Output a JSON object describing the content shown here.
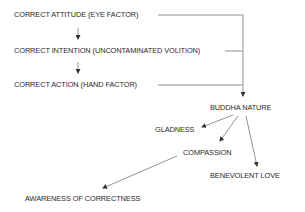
{
  "diagram": {
    "nodes": {
      "attitude": "CORRECT ATTITUDE (EYE FACTOR)",
      "intention": "CORRECT INTENTION (UNCONTAMINATED VOLITION)",
      "action": "CORRECT ACTION (HAND FACTOR)",
      "buddha_nature": "BUDDHA NATURE",
      "gladness": "GLADNESS",
      "compassion": "COMPASSION",
      "benevolent_love": "BENEVOLENT LOVE",
      "awareness": "AWARENESS OF CORRECTNESS"
    },
    "edges": [
      {
        "from": "attitude",
        "to": "intention"
      },
      {
        "from": "intention",
        "to": "action"
      },
      {
        "from": "attitude",
        "to": "buddha_nature"
      },
      {
        "from": "intention",
        "to": "buddha_nature"
      },
      {
        "from": "action",
        "to": "buddha_nature"
      },
      {
        "from": "buddha_nature",
        "to": "gladness"
      },
      {
        "from": "buddha_nature",
        "to": "compassion"
      },
      {
        "from": "buddha_nature",
        "to": "benevolent_love"
      },
      {
        "from": "compassion",
        "to": "awareness"
      }
    ],
    "line_color": "#555555"
  }
}
